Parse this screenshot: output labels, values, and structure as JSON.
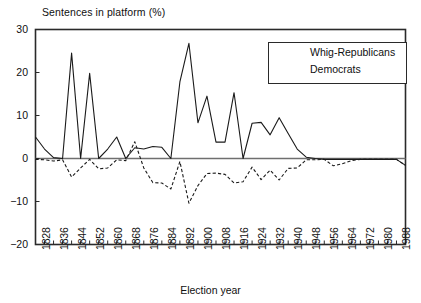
{
  "chart_data": {
    "type": "line",
    "title": "Sentences in platform (%)",
    "xlabel": "Election year",
    "ylabel": "Sentences in platform (%)",
    "ylim": [
      -20,
      30
    ],
    "yticks": [
      30,
      20,
      10,
      0,
      -10,
      -20
    ],
    "ytick_labels": [
      "30",
      "20",
      "10",
      "0",
      "−10",
      "−20"
    ],
    "xlim": [
      1828,
      1992
    ],
    "xtick_step_years": 4,
    "xlabel_step_years": 8,
    "xtick_labels": [
      "1828",
      "1836",
      "1844",
      "1852",
      "1860",
      "1868",
      "1876",
      "1884",
      "1892",
      "1900",
      "1908",
      "1916",
      "1924",
      "1932",
      "1940",
      "1948",
      "1956",
      "1964",
      "1972",
      "1980",
      "1988"
    ],
    "grid": false,
    "legend_position": "top-right",
    "zero_line": true,
    "x": [
      1828,
      1832,
      1836,
      1840,
      1844,
      1848,
      1852,
      1856,
      1860,
      1864,
      1868,
      1872,
      1876,
      1880,
      1884,
      1888,
      1892,
      1896,
      1900,
      1904,
      1908,
      1912,
      1916,
      1920,
      1924,
      1928,
      1932,
      1936,
      1940,
      1944,
      1948,
      1952,
      1956,
      1960,
      1964,
      1968,
      1972,
      1976,
      1980,
      1984,
      1988,
      1992
    ],
    "series": [
      {
        "name": "Whig-Republicans",
        "style": "solid",
        "color": "#1a1a1a",
        "values": [
          5.0,
          2.2,
          0.2,
          0.0,
          24.5,
          0.0,
          19.8,
          0.0,
          2.2,
          5.0,
          0.0,
          2.5,
          2.2,
          2.8,
          2.6,
          0.0,
          17.8,
          26.8,
          8.3,
          14.5,
          3.8,
          3.8,
          15.3,
          0.0,
          8.2,
          8.4,
          5.5,
          9.5,
          5.8,
          2.2,
          0.3,
          0.0,
          -0.2,
          -0.2,
          -0.2,
          -0.2,
          -0.2,
          -0.2,
          -0.2,
          -0.2,
          -0.2,
          -1.6
        ]
      },
      {
        "name": "Democrats",
        "style": "dashed",
        "color": "#1a1a1a",
        "values": [
          -0.2,
          -0.3,
          -0.6,
          -0.3,
          -4.3,
          -2.2,
          -0.2,
          -2.4,
          -2.2,
          -0.3,
          -0.5,
          3.9,
          -2.2,
          -5.6,
          -5.7,
          -7.1,
          -0.7,
          -10.4,
          -6.3,
          -3.5,
          -3.4,
          -3.7,
          -5.7,
          -5.4,
          -2.0,
          -4.9,
          -2.7,
          -5.0,
          -2.3,
          -2.2,
          -0.3,
          -0.3,
          -0.2,
          -1.7,
          -1.2,
          -0.5,
          -0.2,
          -0.2,
          -0.2,
          -0.2,
          -0.2,
          -1.6
        ]
      }
    ]
  },
  "legend": {
    "items": [
      {
        "label": "Whig-Republicans",
        "style": "solid"
      },
      {
        "label": "Democrats",
        "style": "dashed"
      }
    ]
  }
}
